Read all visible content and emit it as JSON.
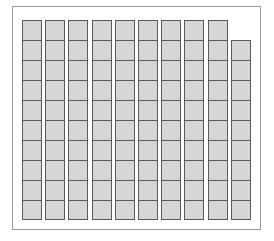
{
  "diagram": {
    "type": "base-ten-blocks",
    "columns": [
      {
        "cells": 10
      },
      {
        "cells": 10
      },
      {
        "cells": 10
      },
      {
        "cells": 10
      },
      {
        "cells": 10
      },
      {
        "cells": 10
      },
      {
        "cells": 10
      },
      {
        "cells": 10
      },
      {
        "cells": 10
      },
      {
        "cells": 9
      }
    ],
    "full_rods": 9,
    "partial_rod_cells": 9,
    "total_units": 99,
    "colors": {
      "cell_fill": "#d6d6d6",
      "cell_border": "#5a5a5a",
      "frame_border": "#9a9a9a",
      "background": "#ffffff"
    }
  }
}
